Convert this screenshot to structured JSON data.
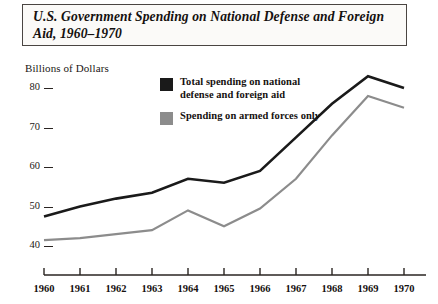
{
  "title": "U.S. Government Spending on National Defense and Foreign Aid, 1960–1970",
  "axis_title": "Billions of Dollars",
  "legend": {
    "items": [
      {
        "label": "Total spending on national defense and foreign aid",
        "color": "#1a1a1a",
        "swatch_name": "legend-swatch-total"
      },
      {
        "label": "Spending on armed forces only",
        "color": "#8c8c8c",
        "swatch_name": "legend-swatch-armed"
      }
    ]
  },
  "chart_data": {
    "type": "line",
    "title": "U.S. Government Spending on National Defense and Foreign Aid, 1960–1970",
    "xlabel": "",
    "ylabel": "Billions of Dollars",
    "x": [
      1960,
      1961,
      1962,
      1963,
      1964,
      1965,
      1966,
      1967,
      1968,
      1969,
      1970
    ],
    "xtick_labels": [
      "1960",
      "1961",
      "1962",
      "1963",
      "1964",
      "1965",
      "1966",
      "1967",
      "1968",
      "1969",
      "1970"
    ],
    "ytick_labels": [
      "40",
      "50",
      "60",
      "70",
      "80"
    ],
    "yticks": [
      40,
      50,
      60,
      70,
      80
    ],
    "ylim": [
      36,
      86
    ],
    "xlim": [
      1960,
      1970
    ],
    "grid": false,
    "legend_position": "inside-top-center",
    "series": [
      {
        "name": "Total spending on national defense and foreign aid",
        "color": "#1a1a1a",
        "values": [
          47.5,
          50.0,
          52.0,
          53.5,
          57.0,
          56.0,
          59.0,
          67.5,
          76.0,
          83.0,
          80.0
        ]
      },
      {
        "name": "Spending on armed forces only",
        "color": "#8c8c8c",
        "values": [
          41.5,
          42.0,
          43.0,
          44.0,
          49.0,
          45.0,
          49.5,
          57.0,
          68.0,
          78.0,
          75.0
        ]
      }
    ]
  }
}
